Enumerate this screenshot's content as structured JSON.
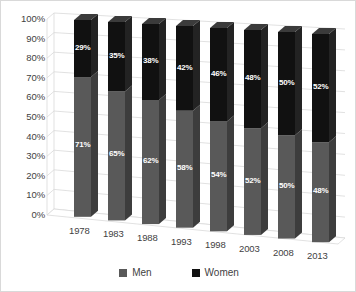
{
  "chart_data": {
    "type": "bar",
    "subtype": "stacked-100-3d",
    "title": "",
    "xlabel": "",
    "ylabel": "",
    "categories": [
      "1978",
      "1983",
      "1988",
      "1993",
      "1998",
      "2003",
      "2008",
      "2013"
    ],
    "series": [
      {
        "name": "Men",
        "color": "#595959",
        "values": [
          71,
          65,
          62,
          58,
          54,
          52,
          50,
          48
        ],
        "labels": [
          "71%",
          "65%",
          "62%",
          "58%",
          "54%",
          "52%",
          "50%",
          "48%"
        ]
      },
      {
        "name": "Women",
        "color": "#111111",
        "values": [
          29,
          35,
          38,
          42,
          46,
          48,
          50,
          52
        ],
        "labels": [
          "29%",
          "35%",
          "38%",
          "42%",
          "46%",
          "48%",
          "50%",
          "52%"
        ]
      }
    ],
    "ylim": [
      0,
      100
    ],
    "ytick_labels": [
      "100%",
      "90%",
      "80%",
      "70%",
      "60%",
      "50%",
      "40%",
      "30%",
      "20%",
      "10%",
      "0%"
    ],
    "ytick_values": [
      100,
      90,
      80,
      70,
      60,
      50,
      40,
      30,
      20,
      10,
      0
    ],
    "grid": true,
    "grid_color": "#d9d9d9",
    "legend_position": "bottom",
    "background": "#ffffff"
  },
  "legend": {
    "items": [
      {
        "label": "Men",
        "color": "#595959"
      },
      {
        "label": "Women",
        "color": "#111111"
      }
    ]
  }
}
